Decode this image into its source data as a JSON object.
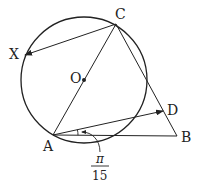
{
  "diagram": {
    "title": "",
    "points": {
      "C": {
        "label": "C",
        "x": 116,
        "y": 24
      },
      "X": {
        "label": "X",
        "x": 25,
        "y": 55
      },
      "O": {
        "label": "O",
        "x": 84,
        "y": 80
      },
      "A": {
        "label": "A",
        "x": 53,
        "y": 135
      },
      "B": {
        "label": "B",
        "x": 177,
        "y": 136
      },
      "D": {
        "label": "D",
        "x": 163,
        "y": 111
      }
    },
    "circle": {
      "center": "O",
      "radius": 63
    },
    "segments": [
      [
        "A",
        "C"
      ],
      [
        "C",
        "B"
      ],
      [
        "A",
        "B"
      ]
    ],
    "vectors": [
      {
        "from": "C",
        "to": "X"
      },
      {
        "from": "A",
        "to": "D"
      }
    ],
    "angle": {
      "vertex": "A",
      "between": [
        "AB",
        "AD"
      ],
      "numerator": "π",
      "denominator": "15"
    },
    "colors": {
      "stroke": "#222222",
      "background": "#ffffff"
    }
  }
}
